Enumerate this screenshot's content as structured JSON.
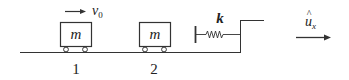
{
  "diagram": {
    "colors": {
      "stroke": "#333333",
      "background": "#ffffff"
    },
    "carts": [
      {
        "id": "1",
        "mass_label": "m",
        "number_label": "1"
      },
      {
        "id": "2",
        "mass_label": "m",
        "number_label": "2"
      }
    ],
    "velocity": {
      "symbol": "v",
      "subscript": "0",
      "direction": "right"
    },
    "spring": {
      "constant_label": "k"
    },
    "unit_vector": {
      "symbol": "u",
      "hat": "^",
      "subscript": "x",
      "direction": "right"
    }
  }
}
